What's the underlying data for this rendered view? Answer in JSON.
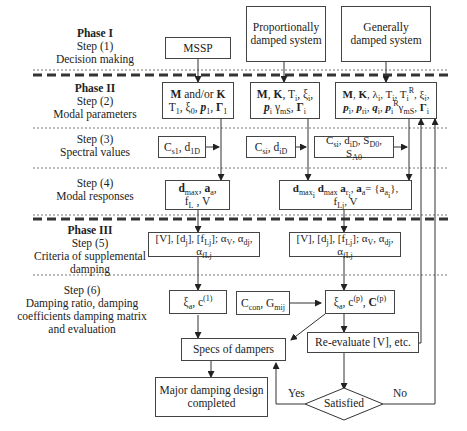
{
  "phases": [
    {
      "id": "phase1",
      "title": "Phase I",
      "steps": [
        {
          "step": "Step (1)",
          "desc": "Decision making"
        }
      ]
    },
    {
      "id": "phase2",
      "title": "Phase II",
      "steps": [
        {
          "step": "Step (2)",
          "desc": "Modal parameters"
        },
        {
          "step": "Step (3)",
          "desc": "Spectral values"
        },
        {
          "step": "Step (4)",
          "desc": "Modal responses"
        }
      ]
    },
    {
      "id": "phase3",
      "title": "Phase III",
      "steps": [
        {
          "step": "Step (5)",
          "desc_lines": [
            "Criteria of supplemental",
            "damping"
          ]
        },
        {
          "step": "Step (6)",
          "desc_lines": [
            "Damping ratio, damping",
            "coefficients damping matrix",
            "and evaluation"
          ]
        }
      ]
    }
  ],
  "nodes": {
    "mssp": "MSSP",
    "proportional": [
      "Proportionally",
      "damped system"
    ],
    "general": [
      "Generally",
      "damped system"
    ],
    "modal_mssp": {
      "line1": "M and/or K",
      "line2": "T1, ξ0, p1, Γ1"
    },
    "modal_prop": {
      "line1": "M, K, Ti, ξi,",
      "line2": "pi γmS, Γi"
    },
    "modal_gen": {
      "line1": "M, K, λi, Ti, TiR, ξi,",
      "line2": "pi, pri, qi, piRγmS, Γi"
    },
    "spec_mssp": "Cs1, d1D",
    "spec_prop": "Csi, diD",
    "spec_gen": "Csi, diD, SD0, SA0",
    "resp_mssp": {
      "line1": "dmax, aa,",
      "line2": "fL, V"
    },
    "resp_multi": {
      "line1": "dmaxi dmax ari, aa= {aai},",
      "line2": "fLj, V"
    },
    "crit_mssp": "[V], [dj], [fLj]; αV, αdj, αfLj",
    "crit_multi": "[V], [dj], [fLj]; αV, αdj, αfLj",
    "damp_mssp": "ξa, c(1)",
    "ccon": "Ccon, Gmij",
    "damp_multi": "ξa, c(p), C(p)",
    "specs": "Specs of dampers",
    "reevaluate": "Re-evaluate [V], etc.",
    "major": [
      "Major damping design",
      "completed"
    ],
    "satisfied": "Satisfied"
  },
  "edge_labels": {
    "yes": "Yes",
    "no": "No"
  }
}
